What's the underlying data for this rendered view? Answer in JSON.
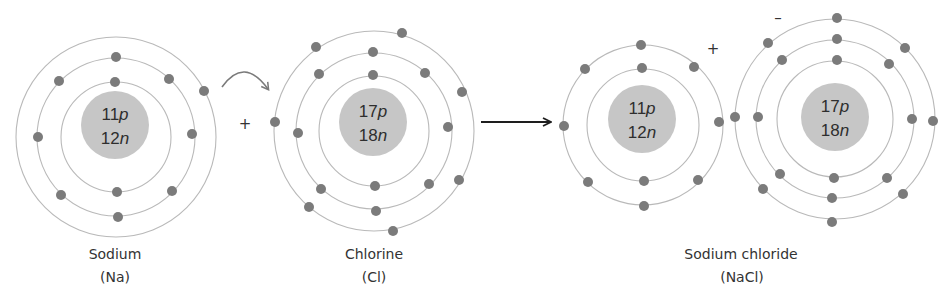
{
  "diagram": {
    "colors": {
      "nucleus": "#c6c6c6",
      "electron": "#7b7b7b",
      "shell": "#b9b9b9",
      "text": "#333333",
      "reaction_arrow": "#1e1e1e",
      "transfer_arrow": "#7a7a7a"
    },
    "atoms": [
      {
        "id": "sodium",
        "label": "Sodium",
        "symbol": "(Na)",
        "label_pos": [
          115,
          259
        ],
        "symbol_pos": [
          115,
          282
        ],
        "nucleus": {
          "cx": 115,
          "cy": 125,
          "r": 34,
          "protons_num": "11",
          "neutrons_num": "12",
          "p_unit": "p",
          "n_unit": "n"
        },
        "shell_center": [
          116,
          137
        ],
        "shells": [
          {
            "r": 55,
            "electrons": [
              [
                115,
                82
              ],
              [
                117,
                192
              ]
            ]
          },
          {
            "r": 79,
            "electrons": [
              [
                116,
                57
              ],
              [
                59,
                81
              ],
              [
                169,
                79
              ],
              [
                38,
                137
              ],
              [
                192,
                134
              ],
              [
                61,
                195
              ],
              [
                172,
                191
              ],
              [
                118,
                217
              ]
            ]
          },
          {
            "r": 100,
            "electrons": [
              [
                204,
                91
              ]
            ]
          }
        ]
      },
      {
        "id": "chlorine",
        "label": "Chlorine",
        "symbol": "(Cl)",
        "label_pos": [
          374,
          259
        ],
        "symbol_pos": [
          374,
          282
        ],
        "nucleus": {
          "cx": 373,
          "cy": 122,
          "r": 34,
          "protons_num": "17",
          "neutrons_num": "18",
          "p_unit": "p",
          "n_unit": "n"
        },
        "shell_center": [
          374,
          131
        ],
        "shells": [
          {
            "r": 55,
            "electrons": [
              [
                373,
                75
              ],
              [
                375,
                186
              ]
            ]
          },
          {
            "r": 78,
            "electrons": [
              [
                373,
                52
              ],
              [
                319,
                74
              ],
              [
                425,
                73
              ],
              [
                298,
                133
              ],
              [
                448,
                127
              ],
              [
                321,
                189
              ],
              [
                429,
                184
              ],
              [
                376,
                211
              ]
            ]
          },
          {
            "r": 100,
            "electrons": [
              [
                402,
                33
              ],
              [
                316,
                47
              ],
              [
                275,
                122
              ],
              [
                309,
                207
              ],
              [
                393,
                231
              ],
              [
                459,
                180
              ],
              [
                462,
                92
              ]
            ]
          }
        ]
      },
      {
        "id": "sodium-ion",
        "label": "",
        "symbol": "",
        "nucleus": {
          "cx": 642,
          "cy": 119,
          "r": 34,
          "protons_num": "11",
          "neutrons_num": "12",
          "p_unit": "p",
          "n_unit": "n"
        },
        "shell_center": [
          643,
          125
        ],
        "shells": [
          {
            "r": 56,
            "electrons": [
              [
                642,
                68
              ],
              [
                644,
                181
              ]
            ]
          },
          {
            "r": 80,
            "electrons": [
              [
                641,
                45
              ],
              [
                585,
                69
              ],
              [
                694,
                67
              ],
              [
                564,
                126
              ],
              [
                719,
                122
              ],
              [
                588,
                182
              ],
              [
                698,
                180
              ],
              [
                644,
                206
              ]
            ]
          }
        ]
      },
      {
        "id": "chloride-ion",
        "label": "",
        "symbol": "",
        "nucleus": {
          "cx": 835,
          "cy": 117,
          "r": 34,
          "protons_num": "17",
          "neutrons_num": "18",
          "p_unit": "p",
          "n_unit": "n"
        },
        "shell_center": [
          835,
          119
        ],
        "shells": [
          {
            "r": 58,
            "electrons": [
              [
                837,
                60
              ],
              [
                834,
                178
              ]
            ]
          },
          {
            "r": 79,
            "electrons": [
              [
                837,
                39
              ],
              [
                782,
                60
              ],
              [
                889,
                64
              ],
              [
                758,
                117
              ],
              [
                912,
                119
              ],
              [
                780,
                174
              ],
              [
                887,
                178
              ],
              [
                832,
                198
              ]
            ]
          },
          {
            "r": 100,
            "electrons": [
              [
                837,
                18
              ],
              [
                768,
                43
              ],
              [
                905,
                48
              ],
              [
                735,
                117
              ],
              [
                933,
                121
              ],
              [
                763,
                189
              ],
              [
                903,
                194
              ],
              [
                832,
                222
              ]
            ]
          }
        ]
      }
    ],
    "product": {
      "label": "Sodium chloride",
      "symbol": "(NaCl)",
      "label_pos": [
        741,
        259
      ],
      "symbol_pos": [
        742,
        282
      ]
    },
    "signs": {
      "reactant_plus": {
        "text": "+",
        "pos": [
          245,
          129
        ]
      },
      "cation_charge": {
        "text": "+",
        "pos": [
          713,
          54
        ]
      },
      "anion_charge": {
        "text": "–",
        "pos": [
          778,
          23
        ]
      }
    },
    "arrows": {
      "transfer": {
        "from": [
          222,
          87
        ],
        "control": [
          244,
          56
        ],
        "to": [
          268,
          89
        ]
      },
      "reaction": {
        "from": [
          481,
          122
        ],
        "to": [
          550,
          122
        ]
      }
    }
  }
}
